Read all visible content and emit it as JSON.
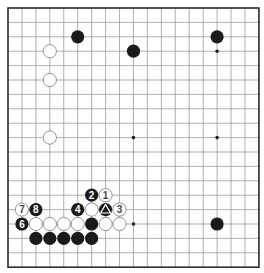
{
  "board": {
    "size": 19,
    "origin_x": 8,
    "origin_y": 8,
    "spacing_x": 13.94,
    "spacing_y": 14.4,
    "stone_radius": 6.6,
    "colors": {
      "line": "#9a9a9a",
      "border": "#333333",
      "black": "#1a1a1a",
      "white": "#ffffff",
      "white_stroke": "#888888",
      "hoshi": "#222222"
    },
    "hoshi": [
      [
        3,
        3
      ],
      [
        9,
        3
      ],
      [
        15,
        3
      ],
      [
        3,
        9
      ],
      [
        9,
        9
      ],
      [
        15,
        9
      ],
      [
        3,
        15
      ],
      [
        9,
        15
      ],
      [
        15,
        15
      ]
    ]
  },
  "stones": [
    {
      "color": "black",
      "col": 5,
      "row": 2,
      "label": ""
    },
    {
      "color": "black",
      "col": 9,
      "row": 3,
      "label": ""
    },
    {
      "color": "black",
      "col": 15,
      "row": 2,
      "label": ""
    },
    {
      "color": "white",
      "col": 3,
      "row": 3,
      "label": ""
    },
    {
      "color": "white",
      "col": 3,
      "row": 5,
      "label": ""
    },
    {
      "color": "white",
      "col": 3,
      "row": 9,
      "label": ""
    },
    {
      "color": "black",
      "col": 15,
      "row": 15,
      "label": ""
    },
    {
      "color": "black",
      "col": 6,
      "row": 13,
      "label": "2"
    },
    {
      "color": "white",
      "col": 7,
      "row": 13,
      "label": "1"
    },
    {
      "color": "white",
      "col": 1,
      "row": 14,
      "label": "7"
    },
    {
      "color": "black",
      "col": 2,
      "row": 14,
      "label": "8"
    },
    {
      "color": "black",
      "col": 5,
      "row": 14,
      "label": "4"
    },
    {
      "color": "white",
      "col": 6,
      "row": 14,
      "label": ""
    },
    {
      "color": "black",
      "col": 7,
      "row": 14,
      "label": "△"
    },
    {
      "color": "white",
      "col": 8,
      "row": 14,
      "label": "3"
    },
    {
      "color": "black",
      "col": 1,
      "row": 15,
      "label": "6"
    },
    {
      "color": "white",
      "col": 2,
      "row": 15,
      "label": ""
    },
    {
      "color": "white",
      "col": 3,
      "row": 15,
      "label": ""
    },
    {
      "color": "white",
      "col": 4,
      "row": 15,
      "label": ""
    },
    {
      "color": "white",
      "col": 5,
      "row": 15,
      "label": ""
    },
    {
      "color": "black",
      "col": 6,
      "row": 15,
      "label": ""
    },
    {
      "color": "white",
      "col": 7,
      "row": 15,
      "label": ""
    },
    {
      "color": "white",
      "col": 8,
      "row": 15,
      "label": ""
    },
    {
      "color": "black",
      "col": 2,
      "row": 16,
      "label": ""
    },
    {
      "color": "black",
      "col": 3,
      "row": 16,
      "label": ""
    },
    {
      "color": "black",
      "col": 4,
      "row": 16,
      "label": ""
    },
    {
      "color": "black",
      "col": 5,
      "row": 16,
      "label": ""
    },
    {
      "color": "black",
      "col": 6,
      "row": 16,
      "label": ""
    }
  ]
}
